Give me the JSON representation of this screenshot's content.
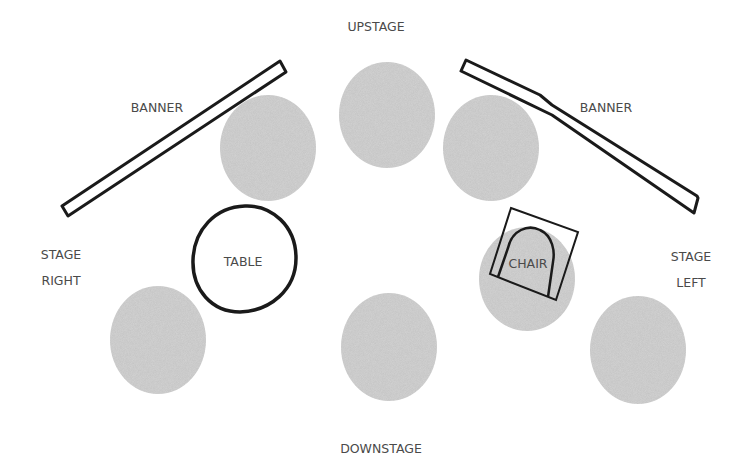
{
  "diagram": {
    "colors": {
      "background": "#ffffff",
      "spot": "#d4d4d4",
      "outline": "#1a1a1a",
      "text": "#4a4a4a"
    },
    "labels": {
      "upstage": "UPSTAGE",
      "downstage": "DOWNSTAGE",
      "stage_right_line1": "STAGE",
      "stage_right_line2": "RIGHT",
      "stage_left_line1": "STAGE",
      "stage_left_line2": "LEFT"
    },
    "banners": [
      {
        "id": "banner-left",
        "label": "BANNER"
      },
      {
        "id": "banner-right",
        "label": "BANNER"
      }
    ],
    "props": {
      "table": {
        "label": "TABLE"
      },
      "chair": {
        "label": "CHAIR"
      }
    },
    "spots": [
      {
        "id": "upstage-right-spot",
        "cx": 268,
        "cy": 148
      },
      {
        "id": "upstage-center-spot",
        "cx": 387,
        "cy": 115
      },
      {
        "id": "upstage-left-spot",
        "cx": 491,
        "cy": 148
      },
      {
        "id": "chair-spot",
        "cx": 527,
        "cy": 279
      },
      {
        "id": "downstage-right-spot",
        "cx": 158,
        "cy": 340
      },
      {
        "id": "downstage-center-spot",
        "cx": 389,
        "cy": 347
      },
      {
        "id": "downstage-left-spot",
        "cx": 638,
        "cy": 350
      }
    ]
  }
}
